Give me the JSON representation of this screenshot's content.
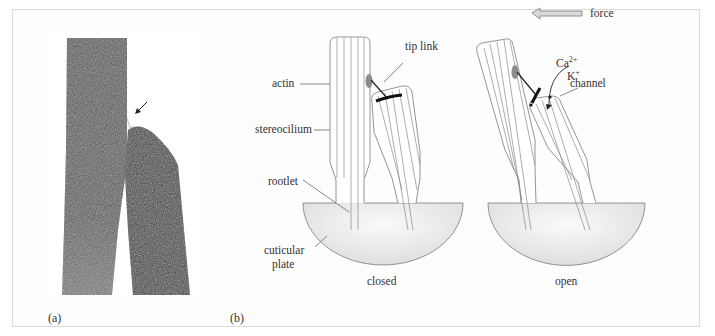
{
  "figure": {
    "panel_a": {
      "label": "(a)",
      "description": "micrograph of two stereocilia with tip link (arrow)"
    },
    "panel_b": {
      "label": "(b)",
      "labels": {
        "actin": "actin",
        "stereocilium": "stereocilium",
        "rootlet": "rootlet",
        "cuticular_plate_line1": "cuticular",
        "cuticular_plate_line2": "plate",
        "tip_link": "tip link",
        "force": "force",
        "ca": "Ca",
        "ca_sup": "2+",
        "k": "K",
        "k_sup": "+",
        "channel": "channel"
      },
      "states": [
        {
          "name": "closed",
          "caption": "closed"
        },
        {
          "name": "open",
          "caption": "open"
        }
      ]
    },
    "colors": {
      "frame_border": "#dcdcdc",
      "photo_dark": "#4a4a4a",
      "outline": "#7a7a7a",
      "tip_link": "#222222",
      "insertion_plaque": "#8c8c8c",
      "cuticular_plate_fill": "#e6e6e6",
      "force_arrow_fill": "#d9d9d9"
    }
  }
}
